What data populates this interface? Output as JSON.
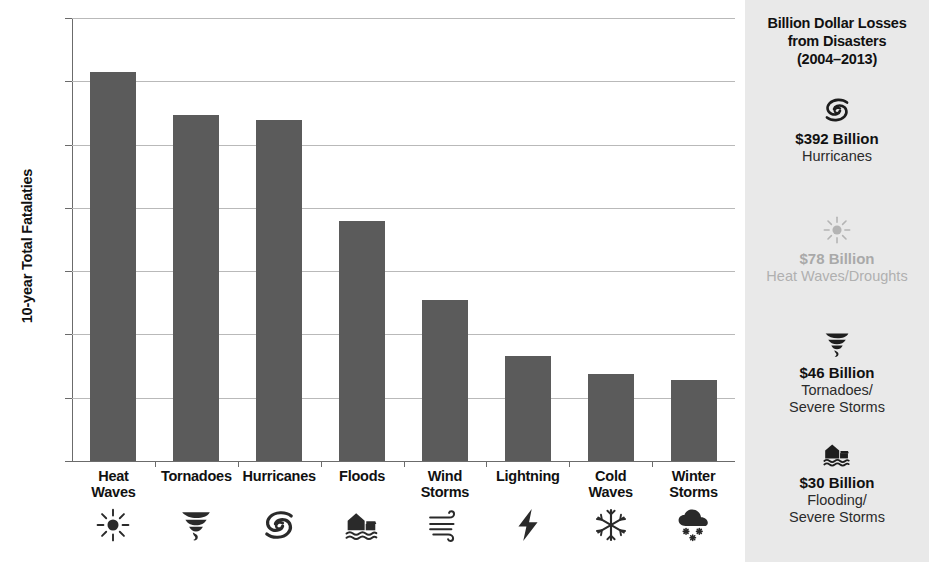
{
  "chart_data": {
    "type": "bar",
    "title": "",
    "xlabel": "",
    "ylabel": "10-year Total Fatalaties",
    "ylim": [
      0,
      1400
    ],
    "ytick_step": 200,
    "yticks": [
      0,
      200,
      400,
      600,
      800,
      1000,
      1200,
      1400
    ],
    "grid": true,
    "legend": "none",
    "bar_color": "#5b5b5b",
    "categories": [
      "Heat Waves",
      "Tornadoes",
      "Hurricanes",
      "Floods",
      "Wind Storms",
      "Lightning",
      "Cold Waves",
      "Winter Storms"
    ],
    "category_lines": [
      [
        "Heat",
        "Waves"
      ],
      [
        "Tornadoes"
      ],
      [
        "Hurricanes"
      ],
      [
        "Floods"
      ],
      [
        "Wind",
        "Storms"
      ],
      [
        "Lightning"
      ],
      [
        "Cold",
        "Waves"
      ],
      [
        "Winter",
        "Storms"
      ]
    ],
    "values": [
      1230,
      1092,
      1077,
      757,
      509,
      332,
      276,
      255
    ],
    "icons": [
      "sun-icon",
      "tornado-icon",
      "hurricane-icon",
      "flood-house-icon",
      "wind-icon",
      "lightning-bolt-icon",
      "snowflake-icon",
      "snow-cloud-icon"
    ]
  },
  "panel": {
    "title_lines": [
      "Billion Dollar Losses",
      "from Disasters",
      "(2004–2013)"
    ],
    "items": [
      {
        "icon": "hurricane-icon",
        "amount": "$392 Billion",
        "category_lines": [
          "Hurricanes"
        ],
        "faded": false
      },
      {
        "icon": "sun-icon",
        "amount": "$78 Billion",
        "category_lines": [
          "Heat Waves/Droughts"
        ],
        "faded": true
      },
      {
        "icon": "tornado-icon",
        "amount": "$46 Billion",
        "category_lines": [
          "Tornadoes/",
          "Severe Storms"
        ],
        "faded": false
      },
      {
        "icon": "flood-house-icon",
        "amount": "$30 Billion",
        "category_lines": [
          "Flooding/",
          "Severe Storms"
        ],
        "faded": false
      }
    ],
    "background_color": "#e9e9e9"
  }
}
